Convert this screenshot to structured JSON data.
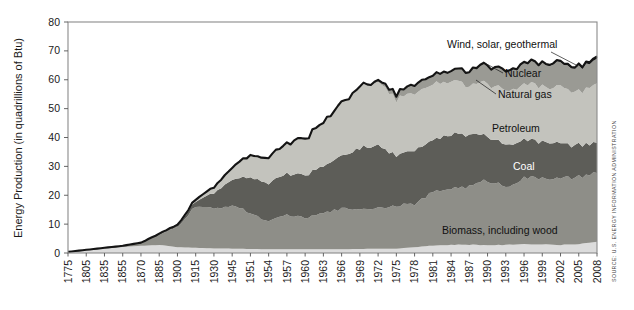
{
  "chart_data": {
    "type": "area",
    "stacked": true,
    "title": "",
    "xlabel": "",
    "ylabel": "Energy Production (in quadrillions of Btu)",
    "ylim": [
      0,
      80
    ],
    "yticks": [
      0,
      10,
      20,
      30,
      40,
      50,
      60,
      70,
      80
    ],
    "grid": false,
    "legend_position": "inline-annotations",
    "source": "SOURCE: U.S. ENERGY INFORMATION ADMINISTRATION",
    "categories": [
      "1775",
      "1805",
      "1835",
      "1855",
      "1870",
      "1885",
      "1900",
      "1915",
      "1930",
      "1945",
      "1951",
      "1954",
      "1957",
      "1960",
      "1963",
      "1966",
      "1969",
      "1972",
      "1975",
      "1978",
      "1981",
      "1984",
      "1987",
      "1990",
      "1993",
      "1996",
      "1999",
      "2002",
      "2005",
      "2008"
    ],
    "tick_labels": [
      "1775",
      "1805",
      "1835",
      "1855",
      "1870",
      "1885",
      "1900",
      "1915",
      "1930",
      "1945",
      "1951",
      "1954",
      "1957",
      "1960",
      "1963",
      "1966",
      "1969",
      "1972",
      "1975",
      "1978",
      "1981",
      "1984",
      "1987",
      "1990",
      "1993",
      "1996",
      "1999",
      "2002",
      "2005",
      "2008"
    ],
    "x": [
      1775,
      1805,
      1835,
      1855,
      1870,
      1885,
      1900,
      1915,
      1930,
      1945,
      1951,
      1954,
      1957,
      1960,
      1963,
      1966,
      1969,
      1972,
      1975,
      1978,
      1981,
      1984,
      1987,
      1990,
      1993,
      1996,
      1999,
      2002,
      2005,
      2008
    ],
    "series": [
      {
        "name": "Biomass, including wood",
        "color": "#dcdcdc",
        "label": "Biomass, including wood",
        "label_color": "#111111",
        "values": [
          0.4,
          1.0,
          1.6,
          2.1,
          2.5,
          2.8,
          2.0,
          1.8,
          1.6,
          1.5,
          1.4,
          1.3,
          1.3,
          1.3,
          1.3,
          1.3,
          1.4,
          1.5,
          1.5,
          2.0,
          2.6,
          2.8,
          2.9,
          2.7,
          2.8,
          3.1,
          3.0,
          2.8,
          3.1,
          3.9
        ]
      },
      {
        "name": "Coal",
        "color": "#8e8e88",
        "label": "Coal",
        "label_color": "#ffffff",
        "values": [
          0.0,
          0.1,
          0.2,
          0.4,
          1.0,
          3.5,
          7.0,
          14.5,
          13.6,
          15.2,
          12.4,
          9.5,
          12.0,
          10.8,
          12.5,
          14.0,
          13.9,
          14.1,
          15.0,
          14.9,
          18.4,
          19.7,
          20.1,
          22.5,
          20.2,
          22.8,
          23.2,
          22.7,
          23.2,
          23.8
        ]
      },
      {
        "name": "Petroleum",
        "color": "#5d5d58",
        "label": "Petroleum",
        "label_color": "#111111",
        "values": [
          0.0,
          0.0,
          0.0,
          0.0,
          0.1,
          0.3,
          0.4,
          1.8,
          5.4,
          9.1,
          12.6,
          13.0,
          14.3,
          14.9,
          16.2,
          18.5,
          21.2,
          21.4,
          17.7,
          18.4,
          18.1,
          18.8,
          17.7,
          15.6,
          14.5,
          13.7,
          12.5,
          12.2,
          10.9,
          10.5
        ]
      },
      {
        "name": "Natural gas",
        "color": "#c3c3bd",
        "label": "Natural gas",
        "label_color": "#111111",
        "values": [
          0.0,
          0.0,
          0.0,
          0.0,
          0.0,
          0.1,
          0.3,
          0.7,
          2.0,
          4.3,
          7.5,
          8.9,
          10.7,
          12.7,
          15.2,
          18.2,
          21.3,
          22.2,
          19.6,
          19.5,
          19.7,
          18.3,
          17.1,
          18.3,
          18.6,
          19.3,
          19.3,
          19.4,
          18.6,
          20.6
        ]
      },
      {
        "name": "Nuclear",
        "color": "#9a9a94",
        "label": "Nuclear",
        "label_color": "#111111",
        "values": [
          0.0,
          0.0,
          0.0,
          0.0,
          0.0,
          0.0,
          0.0,
          0.0,
          0.0,
          0.0,
          0.0,
          0.0,
          0.0,
          0.0,
          0.04,
          0.06,
          0.15,
          0.58,
          1.9,
          3.02,
          3.01,
          3.55,
          4.91,
          6.1,
          6.52,
          7.17,
          7.73,
          8.14,
          8.16,
          8.46
        ]
      },
      {
        "name": "Wind, solar, geothermal",
        "color": "#1a1a1a",
        "label": "Wind, solar, geothermal",
        "label_color": "#111111",
        "values": [
          0.0,
          0.0,
          0.0,
          0.0,
          0.0,
          0.0,
          0.0,
          0.0,
          0.0,
          0.0,
          0.0,
          0.0,
          0.02,
          0.03,
          0.04,
          0.05,
          0.07,
          0.08,
          0.08,
          0.08,
          0.13,
          0.18,
          0.24,
          0.28,
          0.33,
          0.36,
          0.39,
          0.42,
          0.53,
          0.86
        ]
      }
    ],
    "totals": [
      0.4,
      1.1,
      1.8,
      2.5,
      3.6,
      6.7,
      9.7,
      18.8,
      22.6,
      30.1,
      33.9,
      32.7,
      38.3,
      39.7,
      45.3,
      52.1,
      58.0,
      59.9,
      55.8,
      57.9,
      61.9,
      63.3,
      62.9,
      65.5,
      62.9,
      66.4,
      66.1,
      65.7,
      64.5,
      68.1
    ],
    "ymax_label": "80",
    "ymin_label": "0"
  },
  "figure": {
    "source_label": "SOURCE: U.S. ENERGY INFORMATION ADMINISTRATION"
  }
}
